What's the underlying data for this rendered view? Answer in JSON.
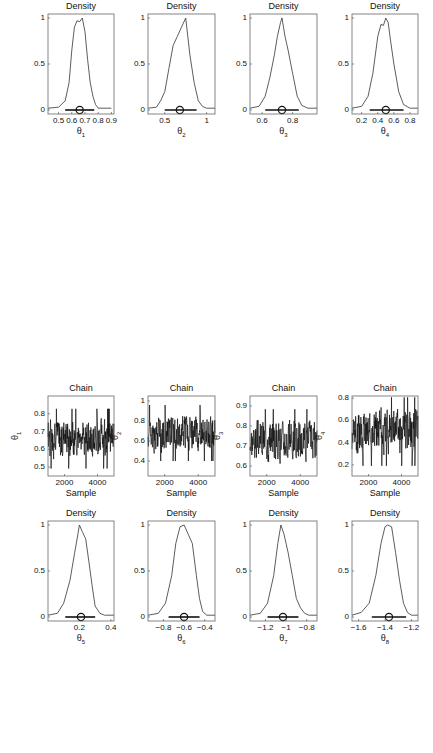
{
  "chart_data": [
    {
      "type": "line",
      "kind": "density",
      "title": "Density",
      "xlabel": "θ",
      "xsub": "1",
      "xticks": [
        0.5,
        0.6,
        0.7,
        0.8,
        0.9
      ],
      "xlim": [
        0.42,
        0.92
      ],
      "ylim": [
        0,
        1
      ],
      "yticks": [
        0,
        0.5,
        1
      ],
      "mean": 0.66,
      "interval": [
        0.55,
        0.77
      ],
      "x": [
        0.42,
        0.5,
        0.55,
        0.58,
        0.6,
        0.62,
        0.64,
        0.66,
        0.68,
        0.7,
        0.72,
        0.74,
        0.76,
        0.78,
        0.8,
        0.9
      ],
      "y": [
        0.02,
        0.03,
        0.1,
        0.3,
        0.65,
        0.9,
        0.97,
        0.96,
        1.0,
        0.85,
        0.55,
        0.3,
        0.15,
        0.06,
        0.02,
        0.02
      ]
    },
    {
      "type": "line",
      "kind": "density",
      "title": "Density",
      "xlabel": "θ",
      "xsub": "2",
      "xticks": [
        0.5,
        1
      ],
      "xlim": [
        0.3,
        1.1
      ],
      "ylim": [
        0,
        1
      ],
      "yticks": [
        0,
        0.5,
        1
      ],
      "mean": 0.68,
      "interval": [
        0.5,
        0.88
      ],
      "x": [
        0.3,
        0.4,
        0.45,
        0.5,
        0.55,
        0.6,
        0.65,
        0.7,
        0.75,
        0.8,
        0.85,
        0.9,
        0.95,
        1.0,
        1.1
      ],
      "y": [
        0.02,
        0.03,
        0.1,
        0.2,
        0.45,
        0.7,
        0.8,
        0.9,
        1.0,
        0.6,
        0.3,
        0.1,
        0.04,
        0.02,
        0.02
      ]
    },
    {
      "type": "line",
      "kind": "density",
      "title": "Density",
      "xlabel": "θ",
      "xsub": "3",
      "xticks": [
        0.6,
        0.8
      ],
      "xlim": [
        0.52,
        0.96
      ],
      "ylim": [
        0,
        1
      ],
      "yticks": [
        0,
        0.5,
        1
      ],
      "mean": 0.73,
      "interval": [
        0.62,
        0.84
      ],
      "x": [
        0.52,
        0.58,
        0.62,
        0.65,
        0.68,
        0.7,
        0.72,
        0.73,
        0.75,
        0.77,
        0.8,
        0.83,
        0.86,
        0.9,
        0.96
      ],
      "y": [
        0.02,
        0.04,
        0.15,
        0.35,
        0.6,
        0.8,
        0.95,
        1.0,
        0.8,
        0.65,
        0.4,
        0.15,
        0.05,
        0.02,
        0.02
      ]
    },
    {
      "type": "line",
      "kind": "density",
      "title": "Density",
      "xlabel": "θ",
      "xsub": "4",
      "xticks": [
        0.2,
        0.4,
        0.6,
        0.8
      ],
      "xlim": [
        0.08,
        0.9
      ],
      "ylim": [
        0,
        1
      ],
      "yticks": [
        0,
        0.5,
        1
      ],
      "mean": 0.5,
      "interval": [
        0.3,
        0.72
      ],
      "x": [
        0.08,
        0.2,
        0.28,
        0.34,
        0.4,
        0.44,
        0.47,
        0.5,
        0.53,
        0.56,
        0.6,
        0.66,
        0.72,
        0.8,
        0.9
      ],
      "y": [
        0.02,
        0.04,
        0.15,
        0.4,
        0.8,
        0.93,
        0.92,
        1.0,
        0.95,
        0.75,
        0.5,
        0.2,
        0.06,
        0.02,
        0.02
      ]
    },
    {
      "type": "line",
      "kind": "trace",
      "title": "Chain",
      "xlabel": "Sample",
      "ylabel": "θ",
      "ysub": "1",
      "xticks": [
        2000,
        4000
      ],
      "xlim": [
        1000,
        5000
      ],
      "yticks": [
        0.5,
        0.6,
        0.7,
        0.8
      ],
      "ylim": [
        0.45,
        0.9
      ],
      "center": 0.66,
      "spread": 0.06,
      "seed": 1
    },
    {
      "type": "line",
      "kind": "trace",
      "title": "Chain",
      "xlabel": "Sample",
      "ylabel": "θ",
      "ysub": "2",
      "xticks": [
        2000,
        4000
      ],
      "xlim": [
        1000,
        5000
      ],
      "yticks": [
        0.4,
        0.6,
        0.8,
        1
      ],
      "ylim": [
        0.25,
        1.05
      ],
      "center": 0.68,
      "spread": 0.1,
      "seed": 2
    },
    {
      "type": "line",
      "kind": "trace",
      "title": "Chain",
      "xlabel": "Sample",
      "ylabel": "θ",
      "ysub": "3",
      "xticks": [
        2000,
        4000
      ],
      "xlim": [
        1000,
        5000
      ],
      "yticks": [
        0.6,
        0.7,
        0.8,
        0.9
      ],
      "ylim": [
        0.55,
        0.95
      ],
      "center": 0.73,
      "spread": 0.055,
      "seed": 3
    },
    {
      "type": "line",
      "kind": "trace",
      "title": "Chain",
      "xlabel": "Sample",
      "ylabel": "θ",
      "ysub": "4",
      "xticks": [
        2000,
        4000
      ],
      "xlim": [
        1000,
        5000
      ],
      "yticks": [
        0.2,
        0.4,
        0.6,
        0.8
      ],
      "ylim": [
        0.1,
        0.82
      ],
      "center": 0.5,
      "spread": 0.11,
      "seed": 4
    },
    {
      "type": "line",
      "kind": "density",
      "title": "Density",
      "xlabel": "θ",
      "xsub": "5",
      "xticks": [
        0.2,
        0.4
      ],
      "xlim": [
        0.0,
        0.42
      ],
      "ylim": [
        0,
        1
      ],
      "yticks": [
        0,
        0.5,
        1
      ],
      "mean": 0.21,
      "interval": [
        0.11,
        0.3
      ],
      "x": [
        0.0,
        0.06,
        0.1,
        0.14,
        0.17,
        0.19,
        0.2,
        0.22,
        0.24,
        0.26,
        0.28,
        0.3,
        0.33,
        0.36,
        0.42
      ],
      "y": [
        0.02,
        0.04,
        0.15,
        0.4,
        0.7,
        0.9,
        1.0,
        0.92,
        0.85,
        0.6,
        0.35,
        0.12,
        0.04,
        0.02,
        0.02
      ]
    },
    {
      "type": "line",
      "kind": "density",
      "title": "Density",
      "xlabel": "θ",
      "xsub": "6",
      "xticks": [
        -0.8,
        -0.6,
        -0.4
      ],
      "xlim": [
        -0.95,
        -0.3
      ],
      "ylim": [
        0,
        1
      ],
      "yticks": [
        0,
        0.5,
        1
      ],
      "mean": -0.6,
      "interval": [
        -0.75,
        -0.45
      ],
      "x": [
        -0.95,
        -0.85,
        -0.78,
        -0.72,
        -0.68,
        -0.64,
        -0.6,
        -0.56,
        -0.52,
        -0.48,
        -0.45,
        -0.42,
        -0.38,
        -0.3
      ],
      "y": [
        0.02,
        0.04,
        0.15,
        0.45,
        0.8,
        0.98,
        1.0,
        0.9,
        0.8,
        0.45,
        0.2,
        0.06,
        0.02,
        0.02
      ]
    },
    {
      "type": "line",
      "kind": "density",
      "title": "Density",
      "xlabel": "θ",
      "xsub": "7",
      "xticks": [
        -1.2,
        -1,
        -0.8
      ],
      "xlim": [
        -1.35,
        -0.7
      ],
      "ylim": [
        0,
        1
      ],
      "yticks": [
        0,
        0.5,
        1
      ],
      "mean": -1.03,
      "interval": [
        -1.18,
        -0.88
      ],
      "x": [
        -1.35,
        -1.25,
        -1.18,
        -1.12,
        -1.08,
        -1.05,
        -1.02,
        -0.98,
        -0.94,
        -0.9,
        -0.86,
        -0.82,
        -0.78,
        -0.7
      ],
      "y": [
        0.02,
        0.04,
        0.15,
        0.45,
        0.8,
        1.0,
        0.9,
        0.7,
        0.45,
        0.2,
        0.1,
        0.04,
        0.02,
        0.02
      ]
    },
    {
      "type": "line",
      "kind": "density",
      "title": "Density",
      "xlabel": "θ",
      "xsub": "8",
      "xticks": [
        -1.6,
        -1.4,
        -1.2
      ],
      "xlim": [
        -1.65,
        -1.15
      ],
      "ylim": [
        0,
        1
      ],
      "yticks": [
        0,
        0.5,
        1
      ],
      "mean": -1.37,
      "interval": [
        -1.5,
        -1.24
      ],
      "x": [
        -1.65,
        -1.58,
        -1.52,
        -1.47,
        -1.43,
        -1.4,
        -1.38,
        -1.35,
        -1.32,
        -1.29,
        -1.26,
        -1.23,
        -1.2,
        -1.15
      ],
      "y": [
        0.02,
        0.05,
        0.15,
        0.45,
        0.8,
        0.98,
        1.0,
        0.98,
        0.7,
        0.4,
        0.15,
        0.05,
        0.02,
        0.02
      ]
    },
    {
      "type": "line",
      "kind": "trace",
      "title": "Chain",
      "xlabel": "Sample",
      "ylabel": "θ",
      "ysub": "5",
      "xticks": [
        2000,
        4000
      ],
      "xlim": [
        1000,
        5000
      ],
      "yticks": [
        0.1,
        0.2,
        0.3
      ],
      "ylim": [
        0.05,
        0.38
      ],
      "center": 0.21,
      "spread": 0.045,
      "seed": 5
    },
    {
      "type": "line",
      "kind": "trace",
      "title": "Chain",
      "xlabel": "Sample",
      "ylabel": "θ",
      "ysub": "6",
      "xticks": [
        2000,
        4000
      ],
      "xlim": [
        1000,
        5000
      ],
      "yticks": [
        -0.8,
        -0.6,
        -0.4
      ],
      "ylim": [
        -0.92,
        -0.32
      ],
      "center": -0.6,
      "spread": 0.07,
      "seed": 6
    },
    {
      "type": "line",
      "kind": "trace",
      "title": "Chain",
      "xlabel": "Sample",
      "ylabel": "θ",
      "ysub": "7",
      "xticks": [
        2000,
        4000
      ],
      "xlim": [
        1000,
        5000
      ],
      "yticks": [
        -1.2,
        -1,
        -0.8
      ],
      "ylim": [
        -1.3,
        -0.72
      ],
      "center": -1.03,
      "spread": 0.07,
      "seed": 7
    },
    {
      "type": "line",
      "kind": "trace",
      "title": "Chain",
      "xlabel": "Sample",
      "ylabel": "θ",
      "ysub": "8",
      "xticks": [
        2000,
        4000
      ],
      "xlim": [
        1000,
        5000
      ],
      "yticks": [
        -1.5,
        -1.4,
        -1.3,
        -1.2
      ],
      "ylim": [
        -1.56,
        -1.18
      ],
      "center": -1.37,
      "spread": 0.06,
      "seed": 8
    },
    {
      "type": "line",
      "kind": "density",
      "title": "Density",
      "xlabel": "θ",
      "xsub": "9",
      "xticks": [
        -0.6,
        -0.4
      ],
      "xlim": [
        -0.68,
        -0.2
      ],
      "ylim": [
        0,
        1
      ],
      "yticks": [
        0,
        0.5,
        1
      ],
      "mean": -0.43,
      "interval": [
        -0.55,
        -0.3
      ],
      "x": [
        -0.68,
        -0.6,
        -0.56,
        -0.54,
        -0.5,
        -0.48,
        -0.46,
        -0.44,
        -0.42,
        -0.4,
        -0.37,
        -0.34,
        -0.3,
        -0.26,
        -0.2
      ],
      "y": [
        0.02,
        0.04,
        0.2,
        0.3,
        0.55,
        0.75,
        0.9,
        0.97,
        0.96,
        1.0,
        0.8,
        0.5,
        0.2,
        0.04,
        0.02
      ]
    },
    {
      "type": "line",
      "kind": "density",
      "title": "Density",
      "xlabel": "θ",
      "xsub": "10",
      "xticks": [
        0.4,
        0.6
      ],
      "xlim": [
        0.38,
        0.8
      ],
      "ylim": [
        0,
        1
      ],
      "yticks": [
        0,
        0.5,
        1
      ],
      "mean": 0.59,
      "interval": [
        0.47,
        0.71
      ],
      "x": [
        0.38,
        0.44,
        0.48,
        0.51,
        0.54,
        0.56,
        0.58,
        0.6,
        0.62,
        0.64,
        0.66,
        0.69,
        0.72,
        0.76,
        0.8
      ],
      "y": [
        0.02,
        0.04,
        0.15,
        0.4,
        0.7,
        0.82,
        0.9,
        1.0,
        0.95,
        0.8,
        0.55,
        0.25,
        0.08,
        0.02,
        0.02
      ]
    },
    {
      "type": "line",
      "kind": "density",
      "title": "Density",
      "xlabel": "σ",
      "xsub": "",
      "xticks": [
        0.1,
        0.15
      ],
      "xlim": [
        0.065,
        0.17
      ],
      "ylim": [
        0,
        1
      ],
      "yticks": [
        0,
        0.5,
        1
      ],
      "mean": 0.1,
      "interval": [
        0.084,
        0.135
      ],
      "x": [
        0.065,
        0.075,
        0.082,
        0.088,
        0.093,
        0.097,
        0.1,
        0.104,
        0.108,
        0.113,
        0.12,
        0.128,
        0.135,
        0.145,
        0.17
      ],
      "y": [
        0.02,
        0.04,
        0.2,
        0.5,
        0.8,
        0.95,
        1.0,
        0.9,
        0.85,
        0.55,
        0.35,
        0.2,
        0.12,
        0.04,
        0.02
      ]
    },
    {
      "type": "line",
      "kind": "density",
      "title": "Density",
      "xlabel": "λ",
      "xsub": "",
      "xticks": [
        0,
        0.02,
        0.04
      ],
      "xlim": [
        -0.002,
        0.05
      ],
      "ylim": [
        0,
        1
      ],
      "yticks": [
        0,
        0.5,
        1
      ],
      "mean": 0.004,
      "interval": [
        0.0,
        0.027
      ],
      "x": [
        -0.002,
        -0.0005,
        0.0005,
        0.002,
        0.004,
        0.006,
        0.008,
        0.01,
        0.013,
        0.016,
        0.02,
        0.025,
        0.03,
        0.04,
        0.05
      ],
      "y": [
        0.02,
        0.02,
        0.6,
        1.0,
        0.85,
        0.65,
        0.48,
        0.35,
        0.25,
        0.17,
        0.1,
        0.05,
        0.03,
        0.02,
        0.02
      ]
    },
    {
      "type": "line",
      "kind": "trace",
      "title": "Chain",
      "xlabel": "Sample",
      "ylabel": "θ",
      "ysub": "9",
      "xticks": [
        2000,
        4000
      ],
      "xlim": [
        1000,
        5000
      ],
      "yticks": [
        -0.6,
        -0.5,
        -0.4,
        -0.3
      ],
      "ylim": [
        -0.66,
        -0.26
      ],
      "center": -0.43,
      "spread": 0.06,
      "seed": 9
    },
    {
      "type": "line",
      "kind": "trace",
      "title": "Chain",
      "xlabel": "Sample",
      "ylabel": "θ",
      "ysub": "10",
      "xticks": [
        2000,
        4000
      ],
      "xlim": [
        1000,
        5000
      ],
      "yticks": [
        0.5,
        0.6,
        0.7
      ],
      "ylim": [
        0.42,
        0.75
      ],
      "center": 0.59,
      "spread": 0.055,
      "seed": 10
    },
    {
      "type": "line",
      "kind": "trace",
      "title": "Chain",
      "xlabel": "Sample",
      "ylabel": "σ",
      "ysub": "",
      "xticks": [
        2000,
        4000
      ],
      "xlim": [
        1000,
        5000
      ],
      "yticks": [
        0.08,
        0.1,
        0.12,
        0.14
      ],
      "ylim": [
        0.072,
        0.155
      ],
      "center": 0.102,
      "spread": 0.012,
      "seed": 11
    },
    {
      "type": "line",
      "kind": "trace",
      "title": "Chain",
      "xlabel": "Sample",
      "ylabel": "λ",
      "ysub": "",
      "xticks": [
        2000,
        4000
      ],
      "xlim": [
        1000,
        5000
      ],
      "yticks": [
        0.01,
        0.02,
        0.03,
        0.04
      ],
      "ylim": [
        0,
        0.048
      ],
      "center": 0.005,
      "spread": 0.008,
      "seed": 12,
      "skewed": true
    }
  ],
  "layout": {
    "columns_x": [
      48,
      148,
      250,
      352
    ],
    "panel_widths": [
      66,
      67,
      67,
      66
    ],
    "rows": [
      {
        "kind": "density",
        "top": 14,
        "height": 100
      },
      {
        "kind": "trace",
        "top": 143,
        "height": 80
      },
      {
        "kind": "density",
        "top": 265,
        "height": 100
      },
      {
        "kind": "trace",
        "top": 396,
        "height": 80
      },
      {
        "kind": "density",
        "top": 521,
        "height": 100
      },
      {
        "kind": "trace",
        "top": 645,
        "height": 80
      }
    ]
  }
}
